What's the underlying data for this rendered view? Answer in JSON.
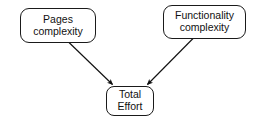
{
  "diagram": {
    "background_color": "#ffffff",
    "stroke_color": "#1a1a1a",
    "text_color": "#111111",
    "nodes": [
      {
        "id": "pages-complexity",
        "shape": "rounded-rectangle",
        "lines": [
          "Pages",
          "complexity"
        ],
        "x": 20,
        "y": 8,
        "w": 76,
        "h": 35
      },
      {
        "id": "functionality-complexity",
        "shape": "rounded-rectangle",
        "lines": [
          "Functionality",
          "complexity"
        ],
        "x": 163,
        "y": 5,
        "w": 83,
        "h": 34
      },
      {
        "id": "total-effort",
        "shape": "rounded-rectangle",
        "lines": [
          "Total",
          "Effort"
        ],
        "x": 106,
        "y": 86,
        "w": 48,
        "h": 30
      }
    ],
    "edges": [
      {
        "id": "pages-to-total",
        "from": "pages-complexity",
        "to": "total-effort",
        "arrowhead": "filled-triangle",
        "label": ""
      },
      {
        "id": "functionality-to-total",
        "from": "functionality-complexity",
        "to": "total-effort",
        "arrowhead": "filled-triangle",
        "label": ""
      }
    ]
  }
}
